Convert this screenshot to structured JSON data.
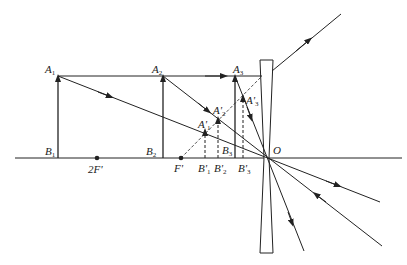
{
  "diagram": {
    "type": "optics-ray-diagram",
    "colors": {
      "line": "#222222",
      "background": "#ffffff"
    },
    "labels": {
      "A1": "A",
      "A1_sub": "1",
      "A2": "A",
      "A2_sub": "2",
      "A3": "A",
      "A3_sub": "3",
      "B1": "B",
      "B1_sub": "1",
      "B2": "B",
      "B2_sub": "2",
      "B3": "B",
      "B3_sub": "3",
      "A1p": "A'",
      "A1p_sub": "1",
      "A2p": "A'",
      "A2p_sub": "2",
      "A3p": "A'",
      "A3p_sub": "3",
      "B1p": "B'",
      "B1p_sub": "1",
      "B2p": "B'",
      "B2p_sub": "2",
      "B3p": "B'",
      "B3p_sub": "3",
      "twoF": "2F'",
      "F": "F'",
      "O": "O"
    },
    "objects": [
      {
        "name": "A1B1",
        "x": 58
      },
      {
        "name": "A2B2",
        "x": 163
      },
      {
        "name": "A3B3",
        "x": 235
      }
    ],
    "images": [
      {
        "name": "A1'B1'",
        "x": 205,
        "virtual": true
      },
      {
        "name": "A2'B2'",
        "x": 218,
        "virtual": true
      },
      {
        "name": "A3'B3'",
        "x": 243,
        "virtual": true
      }
    ],
    "points": [
      {
        "name": "2F'",
        "x": 97
      },
      {
        "name": "F'",
        "x": 181
      },
      {
        "name": "O",
        "x": 268
      }
    ]
  }
}
